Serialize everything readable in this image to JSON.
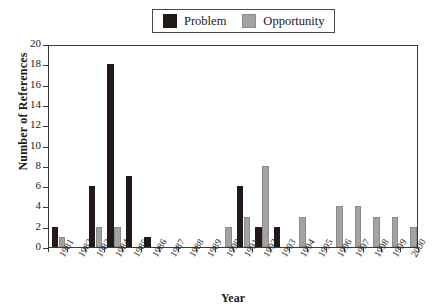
{
  "chart_data": {
    "type": "bar",
    "title": "",
    "xlabel": "Year",
    "ylabel": "Number of References",
    "categories": [
      "1981",
      "1982",
      "1983",
      "1984",
      "1985",
      "1986",
      "1987",
      "1988",
      "1989",
      "1990",
      "1991",
      "1992",
      "1993",
      "1994",
      "1995",
      "1996",
      "1997",
      "1998",
      "1999",
      "2000"
    ],
    "series": [
      {
        "name": "Problem",
        "color": "#231a18",
        "values": [
          2,
          0,
          6,
          18,
          7,
          1,
          0,
          0,
          0,
          0,
          6,
          2,
          2,
          0,
          0,
          0,
          0,
          0,
          0,
          0
        ]
      },
      {
        "name": "Opportunity",
        "color": "#a3a3a3",
        "values": [
          1,
          0,
          2,
          2,
          0,
          0,
          0,
          0,
          0,
          2,
          3,
          8,
          0,
          3,
          0,
          4,
          4,
          3,
          3,
          2
        ]
      }
    ],
    "ylim": [
      0,
      20
    ],
    "yticks": [
      0,
      2,
      4,
      6,
      8,
      10,
      12,
      14,
      16,
      18,
      20
    ],
    "grid": false,
    "legend_position": "top-center"
  },
  "legend": {
    "entries": [
      {
        "label": "Problem",
        "swatch": "problem-swatch-icon"
      },
      {
        "label": "Opportunity",
        "swatch": "opportunity-swatch-icon"
      }
    ]
  },
  "axes": {
    "y_title": "Number of References",
    "x_title": "Year"
  }
}
